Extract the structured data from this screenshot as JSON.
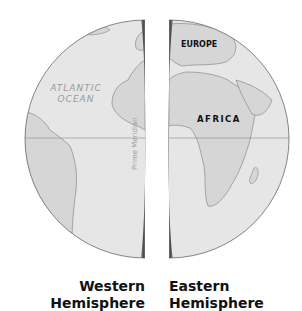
{
  "labels": {
    "atlantic_line1": "ATLANTIC",
    "atlantic_line2": "OCEAN",
    "europe": "EUROPE",
    "africa": "AFRICA",
    "prime_meridian": "Prime Meridian"
  },
  "captions": {
    "western_line1": "Western",
    "western_line2": "Hemisphere",
    "eastern_line1": "Eastern",
    "eastern_line2": "Hemisphere"
  },
  "colors": {
    "ocean": "#e6e6e6",
    "land": "#d6d6d6",
    "edge": "#555555",
    "coast": "#8a8a8a"
  }
}
